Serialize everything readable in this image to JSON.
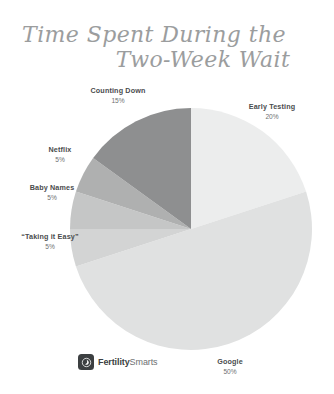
{
  "page": {
    "background": "#ffffff",
    "title_line_1": "Time Spent During the",
    "title_line_2": "Two-Week Wait",
    "title_color": "#9b9d9e"
  },
  "brand": {
    "name_bold": "Fertility",
    "name_light": "Smarts",
    "logo_icon": "fertility-drop-icon",
    "logo_bg": "#3c3f41"
  },
  "chart_data": {
    "type": "pie",
    "title": "Time Spent During the Two-Week Wait",
    "xlabel": "",
    "ylabel": "",
    "legend": "none",
    "grid": false,
    "value_unit": "%",
    "start_angle_deg": 0,
    "direction": "clockwise",
    "categories": [
      "Early Testing",
      "Google",
      "“Taking it Easy”",
      "Baby Names",
      "Netflix",
      "Counting Down"
    ],
    "values": [
      20,
      50,
      5,
      5,
      5,
      15
    ],
    "colors": [
      "#eceded",
      "#e0e1e1",
      "#d3d4d4",
      "#c5c6c6",
      "#afb0b0",
      "#8e8f90"
    ],
    "slices": [
      {
        "label": "Early Testing",
        "value": 20,
        "display": "20%",
        "color": "#eceded"
      },
      {
        "label": "Google",
        "value": 50,
        "display": "50%",
        "color": "#e0e1e1"
      },
      {
        "label": "“Taking it Easy”",
        "value": 5,
        "display": "5%",
        "color": "#d3d4d4"
      },
      {
        "label": "Baby Names",
        "value": 5,
        "display": "5%",
        "color": "#c5c6c6"
      },
      {
        "label": "Netflix",
        "value": 5,
        "display": "5%",
        "color": "#afb0b0"
      },
      {
        "label": "Counting Down",
        "value": 15,
        "display": "15%",
        "color": "#8e8f90"
      }
    ]
  }
}
